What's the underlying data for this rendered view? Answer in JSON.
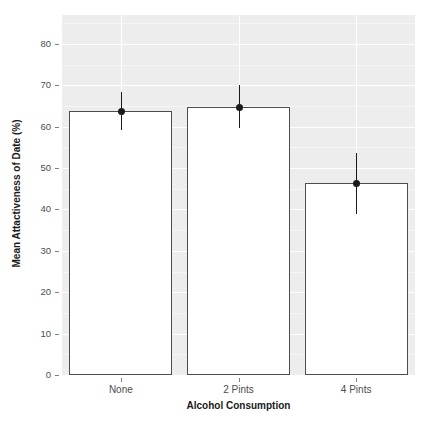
{
  "chart_data": {
    "type": "bar",
    "title": "",
    "subtitle": "",
    "xlabel": "Alcohol Consumption",
    "ylabel": "Mean Attactiveness of Date (%)",
    "categories": [
      "None",
      "2 Pints",
      "4 Pints"
    ],
    "values": [
      63.8,
      64.7,
      46.4
    ],
    "series": [
      {
        "name": "Mean Attactiveness of Date (%)",
        "values": [
          63.8,
          64.7,
          46.4
        ],
        "error_low": [
          59.1,
          59.6,
          38.9
        ],
        "error_high": [
          68.4,
          70.1,
          53.7
        ]
      }
    ],
    "error_bars": true,
    "ylim": [
      0,
      87
    ],
    "xlim": [
      0,
      3
    ],
    "yticks": [
      0,
      10,
      20,
      30,
      40,
      50,
      60,
      70,
      80
    ],
    "ytick_labels": [
      "0",
      "10",
      "20",
      "30",
      "40",
      "50",
      "60",
      "70",
      "80"
    ],
    "xtick_labels": [
      "None",
      "2 Pints",
      "4 Pints"
    ],
    "grid": true,
    "grid_major_color": "#ffffff",
    "grid_minor_color": "#f6f6f6",
    "panel_background": "#ededed",
    "bar_fill": "#ffffff",
    "bar_border": "#4d4d4d",
    "point_color": "#1a1a1a",
    "legend": null,
    "legend_position": "none",
    "point_marker": "filled-circle"
  },
  "axes": {
    "y_title": "Mean Attactiveness of Date (%)",
    "x_title": "Alcohol Consumption",
    "y_labels": [
      "80",
      "70",
      "60",
      "50",
      "40",
      "30",
      "20",
      "10",
      "0"
    ],
    "x_labels": [
      "None",
      "2 Pints",
      "4 Pints"
    ]
  }
}
